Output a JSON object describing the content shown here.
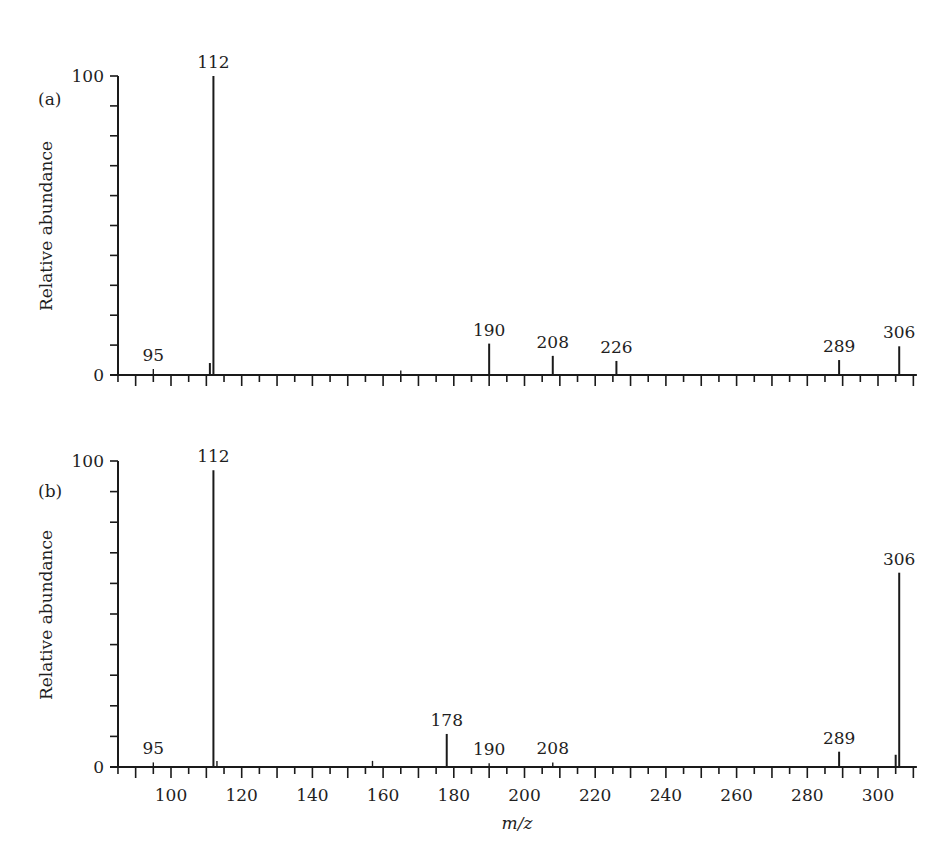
{
  "figure": {
    "xlabel": "m/z",
    "ylabel": "Relative abundance"
  },
  "chart_data": [
    {
      "type": "bar",
      "subtype": "mass-spectrum",
      "panel_label": "(a)",
      "title": "",
      "xlabel": "m/z",
      "ylabel": "Relative abundance",
      "xlim": [
        85,
        311
      ],
      "ylim": [
        0,
        100
      ],
      "y_ticks_labeled": [
        0,
        100
      ],
      "y_minor_step": 10,
      "x_ticks_labeled": [],
      "x_major_step": 10,
      "x_minor_step": 5,
      "grid": false,
      "peaks": [
        {
          "mz": 95,
          "abundance": 2,
          "label": "95"
        },
        {
          "mz": 111,
          "abundance": 4,
          "label": ""
        },
        {
          "mz": 112,
          "abundance": 100,
          "label": "112"
        },
        {
          "mz": 165,
          "abundance": 1.5,
          "label": ""
        },
        {
          "mz": 190,
          "abundance": 10.5,
          "label": "190"
        },
        {
          "mz": 208,
          "abundance": 6.4,
          "label": "208"
        },
        {
          "mz": 226,
          "abundance": 4.7,
          "label": "226"
        },
        {
          "mz": 289,
          "abundance": 5,
          "label": "289"
        },
        {
          "mz": 306,
          "abundance": 9.6,
          "label": "306"
        }
      ]
    },
    {
      "type": "bar",
      "subtype": "mass-spectrum",
      "panel_label": "(b)",
      "title": "",
      "xlabel": "m/z",
      "ylabel": "Relative abundance",
      "xlim": [
        85,
        311
      ],
      "ylim": [
        0,
        100
      ],
      "y_ticks_labeled": [
        0,
        100
      ],
      "y_minor_step": 10,
      "x_ticks_labeled": [
        100,
        120,
        140,
        160,
        180,
        200,
        220,
        240,
        260,
        280,
        300
      ],
      "x_major_step": 10,
      "x_minor_step": 5,
      "grid": false,
      "peaks": [
        {
          "mz": 95,
          "abundance": 1.5,
          "label": "95"
        },
        {
          "mz": 112,
          "abundance": 97,
          "label": "112"
        },
        {
          "mz": 113,
          "abundance": 2,
          "label": ""
        },
        {
          "mz": 157,
          "abundance": 2,
          "label": ""
        },
        {
          "mz": 178,
          "abundance": 10.8,
          "label": "178"
        },
        {
          "mz": 190,
          "abundance": 1.2,
          "label": "190"
        },
        {
          "mz": 208,
          "abundance": 1.5,
          "label": "208"
        },
        {
          "mz": 289,
          "abundance": 5,
          "label": "289"
        },
        {
          "mz": 305,
          "abundance": 4,
          "label": ""
        },
        {
          "mz": 306,
          "abundance": 63.5,
          "label": "306"
        }
      ]
    }
  ]
}
